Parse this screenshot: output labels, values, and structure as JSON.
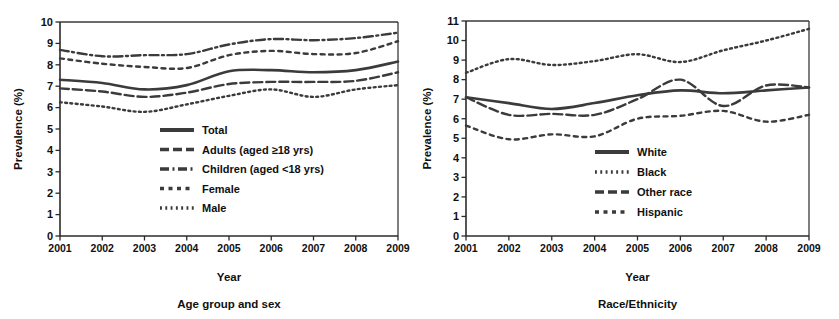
{
  "figure": {
    "width": 839,
    "height": 319,
    "background": "#ffffff",
    "ink_color": "#3b3b3b"
  },
  "chart_data": [
    {
      "type": "line",
      "panel_id": "age-group-and-sex",
      "title": "",
      "caption": "Age group and sex",
      "xlabel": "Year",
      "ylabel": "Prevalence (%)",
      "x": [
        2001,
        2002,
        2003,
        2004,
        2005,
        2006,
        2007,
        2008,
        2009
      ],
      "categories": [
        "2001",
        "2002",
        "2003",
        "2004",
        "2005",
        "2006",
        "2007",
        "2008",
        "2009"
      ],
      "xlim": [
        2001,
        2009
      ],
      "ylim": [
        0,
        10
      ],
      "yticks": [
        0,
        1,
        2,
        3,
        4,
        5,
        6,
        7,
        8,
        9,
        10
      ],
      "grid": false,
      "legend_position": "center-right",
      "series": [
        {
          "name": "Total",
          "dash": "solid",
          "width": 2.6,
          "values": [
            7.3,
            7.15,
            6.85,
            7.05,
            7.7,
            7.75,
            7.65,
            7.75,
            8.15
          ]
        },
        {
          "name": "Adults (aged ≥18 yrs)",
          "dash": "dash",
          "width": 2.4,
          "values": [
            6.9,
            6.75,
            6.5,
            6.7,
            7.1,
            7.2,
            7.2,
            7.25,
            7.65
          ]
        },
        {
          "name": "Children (aged <18 yrs)",
          "dash": "dashdot",
          "width": 2.4,
          "values": [
            8.7,
            8.4,
            8.45,
            8.5,
            8.95,
            9.2,
            9.15,
            9.25,
            9.5
          ]
        },
        {
          "name": "Female",
          "dash": "dashsparse",
          "width": 2.4,
          "values": [
            8.3,
            8.05,
            7.9,
            7.85,
            8.45,
            8.65,
            8.5,
            8.55,
            9.1
          ]
        },
        {
          "name": "Male",
          "dash": "dot",
          "width": 2.4,
          "values": [
            6.25,
            6.05,
            5.8,
            6.15,
            6.55,
            6.85,
            6.5,
            6.85,
            7.05
          ]
        }
      ]
    },
    {
      "type": "line",
      "panel_id": "race-ethnicity",
      "title": "",
      "caption": "Race/Ethnicity",
      "xlabel": "Year",
      "ylabel": "Prevalence (%)",
      "x": [
        2001,
        2002,
        2003,
        2004,
        2005,
        2006,
        2007,
        2008,
        2009
      ],
      "categories": [
        "2001",
        "2002",
        "2003",
        "2004",
        "2005",
        "2006",
        "2007",
        "2008",
        "2009"
      ],
      "xlim": [
        2001,
        2009
      ],
      "ylim": [
        0,
        11
      ],
      "yticks": [
        0,
        1,
        2,
        3,
        4,
        5,
        6,
        7,
        8,
        9,
        10,
        11
      ],
      "grid": false,
      "legend_position": "center-right",
      "series": [
        {
          "name": "White",
          "dash": "solid",
          "width": 2.6,
          "values": [
            7.1,
            6.8,
            6.5,
            6.8,
            7.2,
            7.45,
            7.3,
            7.45,
            7.6
          ]
        },
        {
          "name": "Black",
          "dash": "dot",
          "width": 2.4,
          "values": [
            8.35,
            9.05,
            8.75,
            8.95,
            9.3,
            8.9,
            9.5,
            10.0,
            10.6
          ]
        },
        {
          "name": "Other race",
          "dash": "dash",
          "width": 2.4,
          "values": [
            7.1,
            6.2,
            6.25,
            6.2,
            7.0,
            8.0,
            6.65,
            7.7,
            7.6
          ]
        },
        {
          "name": "Hispanic",
          "dash": "dashsparse",
          "width": 2.4,
          "values": [
            5.65,
            4.95,
            5.2,
            5.1,
            6.0,
            6.15,
            6.4,
            5.85,
            6.2
          ]
        }
      ]
    }
  ]
}
